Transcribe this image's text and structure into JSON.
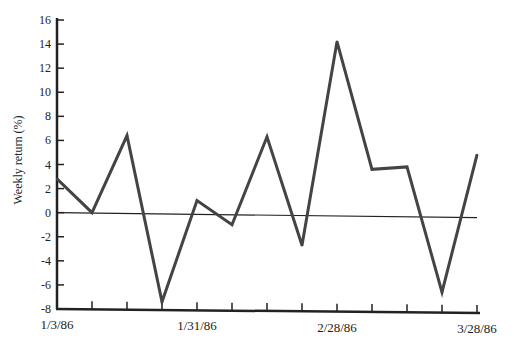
{
  "chart_data": {
    "type": "line",
    "title": "",
    "xlabel": "",
    "ylabel": "Weekly return (%)",
    "ylim": [
      -8,
      16
    ],
    "yticks": [
      16,
      14,
      12,
      10,
      8,
      6,
      4,
      2,
      0,
      -2,
      -4,
      -6,
      -8
    ],
    "x": [
      "1/3/86",
      "1/10/86",
      "1/17/86",
      "1/24/86",
      "1/31/86",
      "2/7/86",
      "2/14/86",
      "2/21/86",
      "2/28/86",
      "3/7/86",
      "3/14/86",
      "3/21/86",
      "3/28/86"
    ],
    "x_tick_labels": [
      {
        "index": 0,
        "label": "1/3/86"
      },
      {
        "index": 4,
        "label": "1/31/86"
      },
      {
        "index": 8,
        "label": "2/28/86"
      },
      {
        "index": 12,
        "label": "3/28/86"
      }
    ],
    "series": [
      {
        "name": "Weekly return",
        "values": [
          2.8,
          0.0,
          6.4,
          -7.4,
          1.0,
          -1.0,
          6.3,
          -2.7,
          14.2,
          3.6,
          3.8,
          -6.6,
          4.8
        ],
        "color": "#444444"
      }
    ],
    "reference_line": {
      "y": 0
    },
    "grid": false,
    "legend": "none"
  }
}
